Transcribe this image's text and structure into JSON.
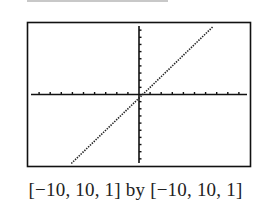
{
  "chart_data": {
    "type": "line",
    "title": "",
    "xlabel": "",
    "ylabel": "",
    "xlim": [
      -10,
      10
    ],
    "ylim": [
      -10,
      10
    ],
    "xscale": 1,
    "yscale": 1,
    "grid": false,
    "legend": null,
    "series": [
      {
        "name": "graph",
        "style": "dotted",
        "x": [
          -6.1,
          0,
          6.7
        ],
        "y": [
          -9.65,
          -0.5,
          9.55
        ]
      }
    ],
    "caption": "[−10, 10, 1] by [−10, 10, 1]"
  },
  "colors": {
    "axis": "#111111",
    "frame": "#111111",
    "curve": "#222222"
  }
}
